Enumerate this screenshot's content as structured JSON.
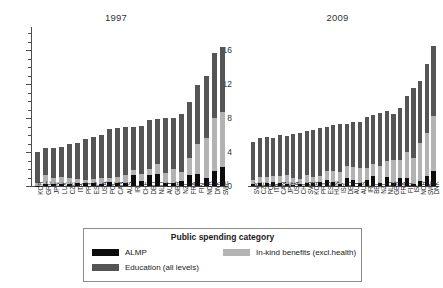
{
  "legend": {
    "title": "Public spending category",
    "entries": [
      {
        "key": "almp",
        "label": "ALMP",
        "color": "#0d0d0d"
      },
      {
        "key": "inkind",
        "label": "In-kind benefits (excl.health)",
        "color": "#b3b3b3"
      },
      {
        "key": "edu",
        "label": "Education (all levels)",
        "color": "#555555"
      }
    ]
  },
  "axis": {
    "y_ticks": [
      "0",
      "4",
      "8",
      "12",
      "16"
    ],
    "y_min": 0,
    "y_max": 18,
    "minor_step": 1
  },
  "chart_data": [
    {
      "type": "bar",
      "title": "1997",
      "xlabel": "",
      "ylabel": "",
      "ylim": [
        0,
        18
      ],
      "grid": false,
      "stacked": true,
      "legend_position": "bottom",
      "categories": [
        "KOR",
        "GRC",
        "JPN",
        "LUX",
        "CZE",
        "ITA",
        "PRT",
        "ESP",
        "USA",
        "POL",
        "CAN",
        "AUS",
        "IRL",
        "CHE",
        "DEU",
        "NLD",
        "AUT",
        "GBR",
        "NZL",
        "FRA",
        "FIN",
        "NOR",
        "DNK",
        "SWE"
      ],
      "series": [
        {
          "name": "ALMP",
          "values": [
            0.05,
            0.25,
            0.2,
            0.2,
            0.2,
            0.3,
            0.3,
            0.3,
            0.2,
            0.45,
            0.35,
            0.4,
            1.3,
            0.6,
            1.25,
            1.4,
            0.4,
            0.3,
            0.55,
            1.3,
            1.45,
            0.9,
            1.75,
            2.2
          ]
        },
        {
          "name": "In-kind benefits (excl.health)",
          "values": [
            0.35,
            1.1,
            0.7,
            0.9,
            0.7,
            0.5,
            0.4,
            0.5,
            0.7,
            0.45,
            0.75,
            0.9,
            0.55,
            0.85,
            0.8,
            1.2,
            1.1,
            1.7,
            1.1,
            2.0,
            3.55,
            4.8,
            6.3,
            6.5
          ]
        },
        {
          "name": "Education (all levels)",
          "values": [
            3.6,
            3.15,
            3.6,
            3.5,
            4.1,
            4.3,
            4.85,
            5.0,
            5.15,
            5.8,
            5.75,
            5.6,
            5.15,
            5.65,
            5.7,
            5.25,
            6.45,
            6.05,
            6.8,
            6.55,
            6.85,
            7.2,
            7.6,
            7.6
          ]
        }
      ],
      "totals": [
        4.0,
        4.5,
        4.5,
        4.6,
        5.0,
        5.1,
        5.55,
        5.8,
        6.05,
        6.7,
        6.85,
        6.9,
        7.0,
        7.1,
        7.75,
        7.85,
        7.95,
        8.05,
        8.45,
        9.85,
        11.85,
        12.9,
        15.65,
        16.3
      ]
    },
    {
      "type": "bar",
      "title": "2009",
      "xlabel": "",
      "ylabel": "",
      "ylim": [
        0,
        18
      ],
      "grid": false,
      "stacked": true,
      "legend_position": "bottom",
      "categories": [
        "SVK",
        "CZE",
        "POL",
        "ITA",
        "CAN",
        "JPN",
        "USA",
        "CHL",
        "SVN",
        "KOR",
        "PRT",
        "ESP",
        "HUN",
        "ISR",
        "DEU",
        "AUT",
        "AUS",
        "IRL",
        "BEL",
        "NZL",
        "NLD",
        "GBR",
        "FRA",
        "FIN",
        "ISL",
        "NOR",
        "SWE",
        "DNK"
      ],
      "series": [
        {
          "name": "ALMP",
          "values": [
            0.2,
            0.3,
            0.35,
            0.45,
            0.3,
            0.2,
            0.15,
            0.2,
            0.3,
            0.35,
            0.5,
            0.75,
            0.45,
            0.2,
            0.9,
            0.75,
            0.4,
            0.75,
            1.2,
            0.35,
            1.05,
            0.35,
            0.9,
            0.95,
            0.25,
            0.6,
            1.15,
            1.75
          ]
        },
        {
          "name": "In-kind benefits (excl.health)",
          "values": [
            0.55,
            0.8,
            0.7,
            0.7,
            0.9,
            1.1,
            0.85,
            0.6,
            1.05,
            0.75,
            0.7,
            1.0,
            1.3,
            1.5,
            1.45,
            1.45,
            1.75,
            1.35,
            1.4,
            2.0,
            1.85,
            2.7,
            2.2,
            3.05,
            3.1,
            4.45,
            5.1,
            6.5
          ]
        },
        {
          "name": "Education (all levels)",
          "values": [
            4.45,
            4.5,
            4.75,
            4.55,
            4.8,
            4.6,
            5.1,
            5.4,
            5.15,
            5.5,
            5.6,
            5.25,
            5.45,
            5.6,
            4.95,
            5.3,
            5.35,
            6.0,
            5.8,
            6.25,
            5.9,
            5.45,
            6.1,
            6.6,
            8.15,
            7.35,
            8.05,
            8.25
          ]
        }
      ],
      "totals": [
        5.2,
        5.6,
        5.8,
        5.7,
        6.0,
        5.9,
        6.1,
        6.2,
        6.5,
        6.6,
        6.8,
        7.0,
        7.2,
        7.3,
        7.3,
        7.5,
        7.5,
        8.1,
        8.4,
        8.6,
        8.8,
        8.5,
        9.2,
        10.6,
        11.5,
        12.4,
        14.3,
        16.5
      ]
    }
  ]
}
